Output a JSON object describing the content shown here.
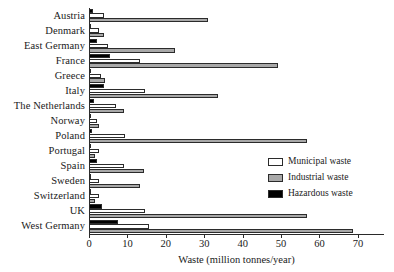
{
  "chart_data": {
    "type": "bar",
    "orientation": "horizontal",
    "title": "",
    "subtitle": "",
    "xlabel": "Waste (million tonnes/year)",
    "ylabel": "",
    "xlim": [
      0,
      76.8
    ],
    "xticks": [
      0,
      10,
      20,
      30,
      40,
      50,
      60,
      70
    ],
    "xtick_labels": [
      "0",
      "10",
      "20",
      "30",
      "40",
      "50",
      "60",
      "70"
    ],
    "grid": false,
    "legend_position": "right-middle",
    "categories": [
      "Austria",
      "Denmark",
      "East Germany",
      "France",
      "Greece",
      "Italy",
      "The Netherlands",
      "Norway",
      "Poland",
      "Portugal",
      "Spain",
      "Sweden",
      "Switzerland",
      "UK",
      "West Germany"
    ],
    "series": [
      {
        "name": "Municipal waste",
        "color": "#ffffff",
        "values": [
          4.0,
          2.6,
          5.0,
          13.3,
          3.1,
          14.5,
          7.0,
          2.0,
          9.4,
          2.6,
          9.1,
          2.5,
          2.6,
          14.6,
          15.6
        ]
      },
      {
        "name": "Industrial waste",
        "color": "#a8a8a8",
        "values": [
          31.0,
          4.0,
          22.4,
          49.2,
          4.2,
          33.6,
          9.0,
          2.5,
          56.8,
          1.6,
          14.3,
          13.2,
          1.6,
          56.8,
          68.7
        ]
      },
      {
        "name": "Hazardous waste",
        "color": "#000000",
        "values": [
          1.1,
          0.6,
          2.1,
          5.5,
          0.6,
          4.0,
          1.2,
          0.6,
          0.9,
          0.3,
          2.0,
          0.6,
          0.6,
          3.3,
          7.5
        ]
      }
    ]
  },
  "legend": {
    "items": [
      {
        "label": "Municipal waste",
        "key": "municipal"
      },
      {
        "label": "Industrial waste",
        "key": "industrial"
      },
      {
        "label": "Hazardous waste",
        "key": "hazardous"
      }
    ]
  },
  "axis": {
    "x_title": "Waste (million tonnes/year)"
  }
}
